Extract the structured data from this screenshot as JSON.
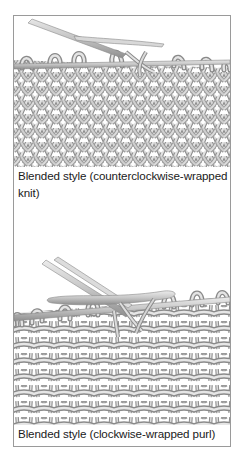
{
  "figures": [
    {
      "id": "knit",
      "illustration": "knitting-needles-stockinette-knit-side",
      "caption_line1": "Blended style (counterclockwise-wrapped",
      "caption_line2": "knit)"
    },
    {
      "id": "purl",
      "illustration": "knitting-needles-stockinette-purl-side",
      "caption_line1": "Blended style (clockwise-wrapped purl)"
    }
  ],
  "colors": {
    "frame_border": "#9a9a9a",
    "yarn_light": "#e4e4e4",
    "yarn_mid": "#b8b8b8",
    "yarn_dark": "#8a8a8a",
    "needle": "#c8c8c8",
    "text": "#1a1a1a"
  }
}
